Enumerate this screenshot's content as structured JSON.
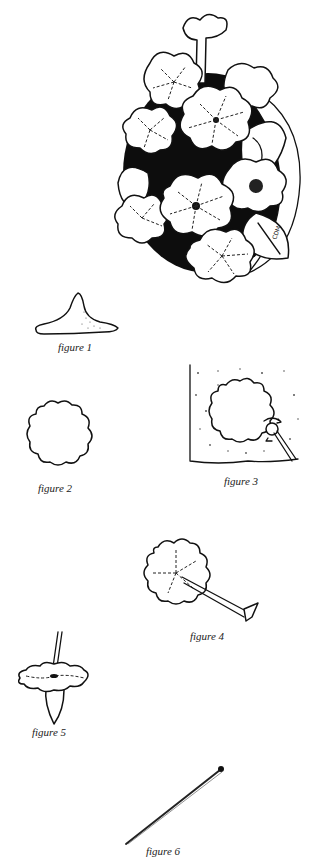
{
  "page": {
    "type": "illustrated craft instruction page",
    "ink_color": "#111111",
    "background": "#ffffff"
  },
  "main_illustration": {
    "subject": "bouquet of primrose-like flowers on dark oval background",
    "signature": "CDM"
  },
  "figures": [
    {
      "id": 1,
      "caption": "figure 1",
      "depicts": "cone-shaped clay base with flat flared bottom"
    },
    {
      "id": 2,
      "caption": "figure 2",
      "depicts": "scalloped flower petal cut-out shape"
    },
    {
      "id": 3,
      "caption": "figure 3",
      "depicts": "flower shape on textured surface being cut with tool, rotation arrows"
    },
    {
      "id": 4,
      "caption": "figure 4",
      "depicts": "scalloped flower with dashed lines marked by tool"
    },
    {
      "id": 5,
      "caption": "figure 5",
      "depicts": "flower placed on cone with wire stem"
    },
    {
      "id": 6,
      "caption": "figure 6",
      "depicts": "long pin / needle tool"
    }
  ]
}
